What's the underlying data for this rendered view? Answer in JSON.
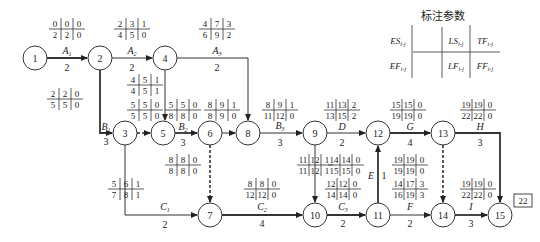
{
  "legend": {
    "title": "标注参数",
    "cells": [
      "ES_i-j",
      "LS_i-j",
      "TF_i-j",
      "EF_i-j",
      "LF_i-j",
      "FF_i-j"
    ],
    "cells_display": [
      [
        "ES",
        "i-j"
      ],
      [
        "LS",
        "i-j"
      ],
      [
        "TF",
        "i-j"
      ],
      [
        "EF",
        "i-j"
      ],
      [
        "LF",
        "i-j"
      ],
      [
        "FF",
        "i-j"
      ]
    ]
  },
  "project_duration": "22",
  "nodes": [
    {
      "id": "1",
      "x": 35,
      "y": 58
    },
    {
      "id": "2",
      "x": 100,
      "y": 58
    },
    {
      "id": "4",
      "x": 165,
      "y": 58
    },
    {
      "id": "3",
      "x": 125,
      "y": 133
    },
    {
      "id": "5",
      "x": 163,
      "y": 133
    },
    {
      "id": "6",
      "x": 210,
      "y": 133
    },
    {
      "id": "8",
      "x": 248,
      "y": 133
    },
    {
      "id": "9",
      "x": 315,
      "y": 133
    },
    {
      "id": "12",
      "x": 378,
      "y": 133
    },
    {
      "id": "13",
      "x": 443,
      "y": 133
    },
    {
      "id": "7",
      "x": 210,
      "y": 215
    },
    {
      "id": "10",
      "x": 315,
      "y": 215
    },
    {
      "id": "11",
      "x": 378,
      "y": 215
    },
    {
      "id": "14",
      "x": 443,
      "y": 215
    },
    {
      "id": "15",
      "x": 500,
      "y": 215
    }
  ],
  "activities": [
    {
      "name": "A1",
      "duration": "2",
      "from": "1",
      "to": "2",
      "params": [
        "0",
        "0",
        "0",
        "2",
        "2",
        "0"
      ]
    },
    {
      "name": "A2",
      "duration": "2",
      "from": "2",
      "to": "4",
      "params": [
        "2",
        "3",
        "1",
        "4",
        "5",
        "0"
      ]
    },
    {
      "name": "A3",
      "duration": "2",
      "from": "4",
      "to": "8",
      "params": [
        "4",
        "7",
        "3",
        "6",
        "9",
        "2"
      ]
    },
    {
      "name": "B1",
      "duration": "3",
      "from": "2",
      "to": "3",
      "params": [
        "2",
        "2",
        "0",
        "5",
        "5",
        "0"
      ]
    },
    {
      "name": "dummy 4-5",
      "duration": "",
      "from": "4",
      "to": "5",
      "params": [
        "4",
        "5",
        "1",
        "4",
        "5",
        "1"
      ]
    },
    {
      "name": "dummy 3-5",
      "duration": "",
      "from": "3",
      "to": "5",
      "params": [
        "5",
        "5",
        "0",
        "5",
        "5",
        "0"
      ]
    },
    {
      "name": "B2",
      "duration": "3",
      "from": "5",
      "to": "6",
      "params": [
        "5",
        "5",
        "0",
        "8",
        "8",
        "0"
      ]
    },
    {
      "name": "dummy 6-8",
      "duration": "",
      "from": "6",
      "to": "8",
      "params": [
        "8",
        "9",
        "1",
        "8",
        "9",
        "0"
      ]
    },
    {
      "name": "B3",
      "duration": "3",
      "from": "8",
      "to": "9",
      "params": [
        "8",
        "9",
        "1",
        "11",
        "12",
        "0"
      ]
    },
    {
      "name": "dummy 6-7",
      "duration": "",
      "from": "6",
      "to": "7",
      "params": [
        "8",
        "8",
        "0",
        "8",
        "8",
        "0"
      ]
    },
    {
      "name": "C1",
      "duration": "2",
      "from": "3",
      "to": "7",
      "params": [
        "5",
        "6",
        "1",
        "7",
        "8",
        "1"
      ]
    },
    {
      "name": "C2",
      "duration": "4",
      "from": "7",
      "to": "10",
      "params": [
        "8",
        "8",
        "0",
        "12",
        "12",
        "0"
      ]
    },
    {
      "name": "dummy 9-10",
      "duration": "",
      "from": "9",
      "to": "10",
      "params": [
        "11",
        "12",
        "1",
        "11",
        "12",
        "1"
      ]
    },
    {
      "name": "D",
      "duration": "2",
      "from": "9",
      "to": "12",
      "params": [
        "11",
        "13",
        "2",
        "13",
        "15",
        "2"
      ]
    },
    {
      "name": "C3",
      "duration": "2",
      "from": "10",
      "to": "11",
      "params": [
        "12",
        "12",
        "0",
        "14",
        "14",
        "0"
      ]
    },
    {
      "name": "E",
      "duration": "1",
      "from": "11",
      "to": "12",
      "params": [
        "14",
        "14",
        "0",
        "15",
        "15",
        "0"
      ]
    },
    {
      "name": "G",
      "duration": "4",
      "from": "12",
      "to": "13",
      "params": [
        "15",
        "15",
        "0",
        "19",
        "19",
        "0"
      ]
    },
    {
      "name": "H",
      "duration": "3",
      "from": "13",
      "to": "15",
      "params": [
        "19",
        "19",
        "0",
        "22",
        "22",
        "0"
      ]
    },
    {
      "name": "dummy 13-14",
      "duration": "",
      "from": "13",
      "to": "14",
      "params": [
        "19",
        "19",
        "0",
        "19",
        "19",
        "0"
      ]
    },
    {
      "name": "F",
      "duration": "2",
      "from": "11",
      "to": "14",
      "params": [
        "14",
        "17",
        "3",
        "16",
        "19",
        "3"
      ]
    },
    {
      "name": "I",
      "duration": "3",
      "from": "14",
      "to": "15",
      "params": [
        "19",
        "19",
        "0",
        "22",
        "22",
        "0"
      ]
    }
  ],
  "labels": {
    "A1": "A",
    "A1_sub": "1",
    "A2": "A",
    "A2_sub": "2",
    "A3": "A",
    "A3_sub": "3",
    "B1": "B",
    "B1_sub": "1",
    "B2": "B",
    "B2_sub": "2",
    "B3": "B",
    "B3_sub": "3",
    "C1": "C",
    "C1_sub": "1",
    "C2": "C",
    "C2_sub": "2",
    "C3": "C",
    "C3_sub": "3",
    "D": "D",
    "E": "E",
    "F": "F",
    "G": "G",
    "H": "H",
    "I": "I"
  }
}
